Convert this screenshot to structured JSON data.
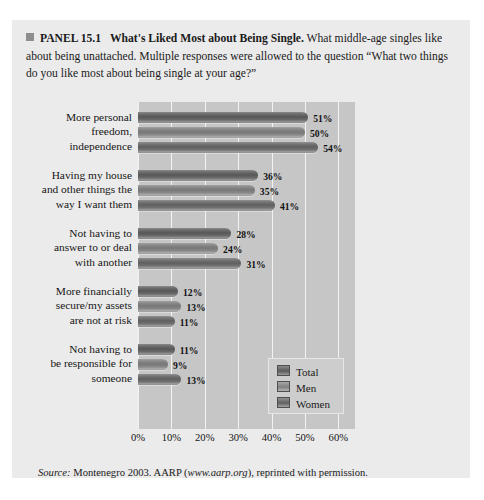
{
  "panel": {
    "bullet_icon": "filled-square-icon",
    "label": "PANEL 15.1",
    "title": "What's Liked Most about Being Single.",
    "description_line1": "What middle-age",
    "description_line2": "singles like about being unattached. Multiple responses were allowed to the",
    "description_line3": "question “What two things do you like most about being single at your age?”"
  },
  "source": {
    "label": "Source:",
    "text_before": " Montenegro 2003. AARP (",
    "url": "www.aarp.org",
    "text_after": "), reprinted with permission."
  },
  "legend": {
    "items": [
      {
        "label": "Total",
        "swatch": "total"
      },
      {
        "label": "Men",
        "swatch": "men"
      },
      {
        "label": "Women",
        "swatch": "women"
      }
    ]
  },
  "chart_data": {
    "type": "bar",
    "orientation": "horizontal",
    "title": "What's Liked Most about Being Single",
    "xlabel": "",
    "ylabel": "",
    "xlim": [
      0,
      65
    ],
    "grid": true,
    "legend_position": "inside-bottom-right",
    "tick_labels": [
      "0%",
      "10%",
      "20%",
      "30%",
      "40%",
      "50%",
      "60%"
    ],
    "tick_values": [
      0,
      10,
      20,
      30,
      40,
      50,
      60
    ],
    "categories": [
      "More personal freedom, independence",
      "Having my house and other things the way I want them",
      "Not having to answer to or deal with another",
      "More financially secure/my assets are not at risk",
      "Not having to be responsible for someone"
    ],
    "category_lines": [
      [
        "More personal",
        "freedom,",
        "independence"
      ],
      [
        "Having my house",
        "and other things the",
        "way I want them"
      ],
      [
        "Not having to",
        "answer to or deal",
        "with another"
      ],
      [
        "More financially",
        "secure/my assets",
        "are not at risk"
      ],
      [
        "Not having to",
        "be responsible for",
        "someone"
      ]
    ],
    "series": [
      {
        "name": "Total",
        "values": [
          51,
          36,
          28,
          12,
          11
        ],
        "labels": [
          "51%",
          "36%",
          "28%",
          "12%",
          "11%"
        ]
      },
      {
        "name": "Men",
        "values": [
          50,
          35,
          24,
          13,
          9
        ],
        "labels": [
          "50%",
          "35%",
          "24%",
          "13%",
          "9%"
        ]
      },
      {
        "name": "Women",
        "values": [
          54,
          41,
          31,
          11,
          13
        ],
        "labels": [
          "54%",
          "41%",
          "31%",
          "11%",
          "13%"
        ]
      }
    ]
  },
  "colors": {
    "panel_background": "#ebebeb",
    "plot_background": "#c6c6c6",
    "gridline": "#f2f2f2",
    "bar_total": "#575757",
    "bar_men": "#777777",
    "bar_women": "#5f5f5f"
  }
}
